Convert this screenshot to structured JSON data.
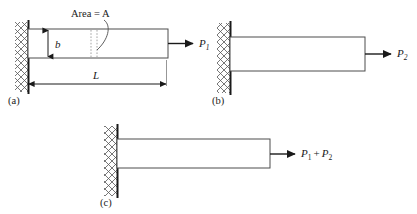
{
  "figure": {
    "title_present": false,
    "colors": {
      "line": "#1a1a1a",
      "bar_outline": "#4d4d4d",
      "hatch": "#555555",
      "dashed": "#999999",
      "background": "#ffffff"
    }
  },
  "panels": [
    {
      "id": "a",
      "caption": "(a)",
      "force_label": "P",
      "force_sub": "1",
      "force_label_full": "P1",
      "annotations": {
        "area": "Area = A",
        "height": "b",
        "length": "L"
      }
    },
    {
      "id": "b",
      "caption": "(b)",
      "force_label": "P",
      "force_sub": "2",
      "force_label_full": "P2",
      "annotations": {}
    },
    {
      "id": "c",
      "caption": "(c)",
      "force_label_part1": "P",
      "force_sub1": "1",
      "force_plus": "+",
      "force_label_part2": "P",
      "force_sub2": "2",
      "force_label_full": "P1 + P2",
      "annotations": {}
    }
  ],
  "icons": {
    "wall": "fixed-support-hatch-icon",
    "arrow": "force-arrow-icon",
    "dimension": "dimension-arrow-icon"
  }
}
